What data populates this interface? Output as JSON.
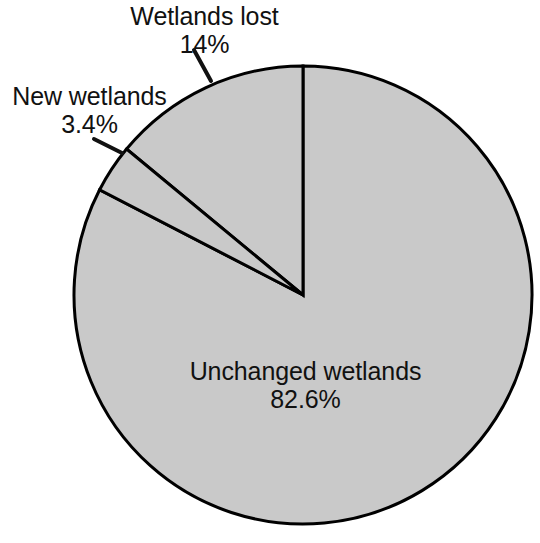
{
  "chart_data": {
    "type": "pie",
    "title": "",
    "subtitle": "",
    "xlabel": "",
    "ylabel": "",
    "legend_position": "none",
    "grid": false,
    "units": "percent",
    "start_angle_deg": 90,
    "direction": "counterclockwise",
    "categories": [
      "Wetlands lost",
      "New wetlands",
      "Unchanged wetlands"
    ],
    "values": [
      14,
      3.4,
      82.6
    ],
    "value_labels": [
      "14%",
      "3.4%",
      "82.6%"
    ],
    "slices": [
      {
        "name": "Wetlands lost",
        "value": 14,
        "value_label": "14%",
        "label_placement": "outside",
        "fill": "#c9c9c9",
        "stroke": "#000000"
      },
      {
        "name": "New wetlands",
        "value": 3.4,
        "value_label": "3.4%",
        "label_placement": "outside",
        "fill": "#c9c9c9",
        "stroke": "#000000"
      },
      {
        "name": "Unchanged wetlands",
        "value": 82.6,
        "value_label": "82.6%",
        "label_placement": "inside",
        "fill": "#c9c9c9",
        "stroke": "#000000"
      }
    ],
    "colors": {
      "slice_fill": "#c9c9c9",
      "outline": "#000000",
      "background": "#ffffff",
      "text": "#111111"
    },
    "geometry": {
      "center_x": 303,
      "center_y": 295,
      "radius": 229
    }
  },
  "labels": {
    "wetlands_lost": {
      "name": "Wetlands lost",
      "value": "14%"
    },
    "new_wetlands": {
      "name": "New wetlands",
      "value": "3.4%"
    },
    "unchanged_wetlands": {
      "name": "Unchanged wetlands",
      "value": "82.6%"
    }
  }
}
